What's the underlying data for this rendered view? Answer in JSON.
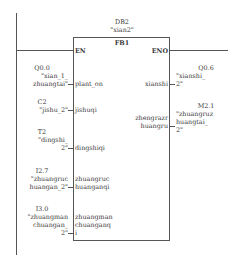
{
  "block": {
    "instance_db": "DB2",
    "instance_symbol": "\"xian2\"",
    "type": "FB1",
    "en_label": "EN",
    "eno_label": "ENO"
  },
  "inputs": [
    {
      "address": "Q0.0",
      "symbol_lines": [
        "\"xian_1_",
        "zhuangtai\""
      ],
      "pin": [
        "plant_on"
      ]
    },
    {
      "address": "C2",
      "symbol_lines": [
        "\"jishu_2\""
      ],
      "pin": [
        "jishuqi"
      ]
    },
    {
      "address": "T2",
      "symbol_lines": [
        "\"dingshi_",
        "2\""
      ],
      "pin": [
        "dingshiqi"
      ]
    },
    {
      "address": "I2.7",
      "symbol_lines": [
        "\"zhuangruc",
        "huangan_2\""
      ],
      "pin": [
        "zhuangruc",
        "huanganqi"
      ]
    },
    {
      "address": "I3.0",
      "symbol_lines": [
        "\"zhuangman",
        "chuangan_",
        "2\""
      ],
      "pin": [
        "zhuangman",
        "chuanganq",
        "i"
      ]
    }
  ],
  "outputs": [
    {
      "address": "Q0.6",
      "symbol_lines": [
        "\"xianshi_",
        "2\""
      ],
      "pin": [
        "xianshi"
      ]
    },
    {
      "address": "M2.1",
      "symbol_lines": [
        "\"zhuangruz",
        "huangtai_",
        "2\""
      ],
      "pin": [
        "zhengrazr",
        "huangru"
      ]
    }
  ],
  "colors": {
    "line": "#555555",
    "text": "#3a3a3a",
    "background": "#ffffff"
  }
}
